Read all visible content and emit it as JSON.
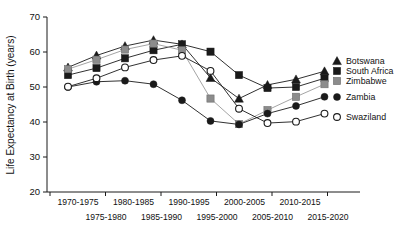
{
  "chart_data": {
    "type": "line",
    "title": "",
    "xlabel": "",
    "ylabel": "Life Expectancy at Birth (years)",
    "ylim": [
      20,
      70
    ],
    "yticks": [
      20,
      30,
      40,
      50,
      60,
      70
    ],
    "ytick_labels": [
      "20",
      "30",
      "40",
      "50",
      "60",
      "70"
    ],
    "grid": false,
    "legend_position": "right",
    "categories": [
      "1970-1975",
      "1975-1980",
      "1980-1985",
      "1985-1990",
      "1990-1995",
      "1995-2000",
      "2000-2005",
      "2005-2010",
      "2010-2015",
      "2015-2020"
    ],
    "xtick_labels_row1": [
      "1970-1975",
      "1980-1985",
      "1990-1995",
      "2000-2005",
      "2010-2015"
    ],
    "xtick_labels_row2": [
      "1975-1980",
      "1985-1990",
      "1995-2000",
      "2005-2010",
      "2015-2020"
    ],
    "series": [
      {
        "name": "Botswana",
        "marker": "filled-triangle",
        "color": "#1a1a1a",
        "line_color": "#1a1a1a",
        "values": [
          55.6,
          59.0,
          61.7,
          63.4,
          62.2,
          52.6,
          46.7,
          50.6,
          52.2,
          54.5
        ]
      },
      {
        "name": "South Africa",
        "marker": "filled-square",
        "color": "#1a1a1a",
        "line_color": "#1a1a1a",
        "values": [
          53.4,
          55.4,
          58.2,
          60.5,
          62.2,
          60.1,
          53.4,
          49.7,
          50.0,
          52.5
        ]
      },
      {
        "name": "Zimbabwe",
        "marker": "gray-square",
        "color": "#8c8c8c",
        "line_color": "#9a9a9a",
        "values": [
          55.1,
          57.8,
          60.7,
          62.4,
          60.5,
          46.7,
          39.4,
          43.4,
          47.2,
          50.8
        ]
      },
      {
        "name": "Zambia",
        "marker": "filled-circle",
        "color": "#1a1a1a",
        "line_color": "#1a1a1a",
        "values": [
          50.0,
          51.5,
          51.8,
          50.8,
          46.2,
          40.3,
          39.3,
          42.4,
          44.6,
          47.2
        ]
      },
      {
        "name": "Swaziland",
        "marker": "open-circle",
        "color": "#ffffff",
        "line_color": "#1a1a1a",
        "values": [
          50.1,
          52.5,
          55.6,
          57.7,
          58.9,
          54.6,
          43.8,
          39.7,
          40.1,
          42.4
        ]
      }
    ]
  },
  "legend": {
    "items": [
      {
        "label": "Botswana"
      },
      {
        "label": "South Africa"
      },
      {
        "label": "Zimbabwe"
      },
      {
        "label": "Zambia"
      },
      {
        "label": "Swaziland"
      }
    ]
  }
}
